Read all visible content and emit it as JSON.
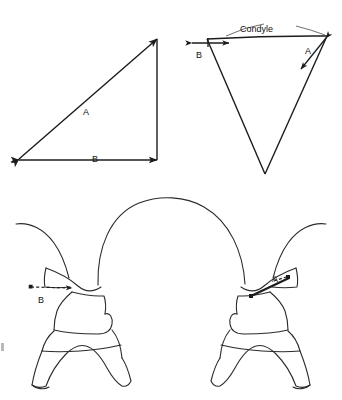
{
  "figure": {
    "background_color": "#ffffff",
    "line_color": "#1c1c1c",
    "panels": [
      {
        "name": "right-triangle-panel",
        "position": "top-left",
        "description": "Right triangle with hypotenuse labeled A and base labeled B",
        "labels": [
          {
            "id": "tri-left-A",
            "text": "A"
          },
          {
            "id": "tri-left-B",
            "text": "B"
          }
        ]
      },
      {
        "name": "inverted-triangle-panel",
        "position": "top-right",
        "description": "Inverted triangle representing condyle with dimension A and dimension B",
        "labels": [
          {
            "id": "condyle-caption",
            "text": "Condyle"
          },
          {
            "id": "tri-right-A",
            "text": "A"
          },
          {
            "id": "tri-right-B",
            "text": "B"
          }
        ]
      },
      {
        "name": "anatomy-panel",
        "position": "bottom",
        "description": "Coronal section of skull base showing bilateral condyles with measurement A on the right side and measurement B on the left side",
        "labels": [
          {
            "id": "anatomy-B",
            "text": "B"
          },
          {
            "id": "anatomy-A",
            "text": "A"
          }
        ]
      }
    ]
  },
  "labels": {
    "triangle_left": {
      "hypotenuse": "A",
      "base": "B"
    },
    "triangle_right": {
      "condyle": "Condyle",
      "diagonal": "A",
      "horizontal": "B"
    },
    "anatomy": {
      "left_measure": "B",
      "right_measure": "A"
    }
  }
}
